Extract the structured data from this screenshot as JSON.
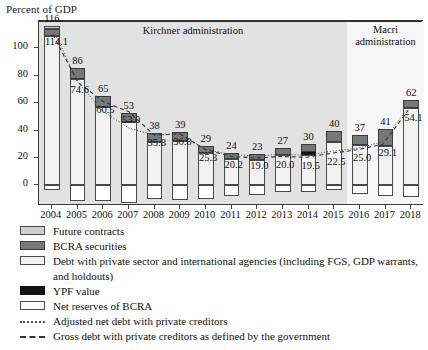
{
  "chart_data": {
    "type": "bar",
    "title": "Percent of GDP",
    "ylabel": "Percent of GDP",
    "xlabel": "",
    "ylim": [
      -15,
      120
    ],
    "yticks": [
      0,
      20,
      40,
      60,
      80,
      100
    ],
    "grid": false,
    "stacked": true,
    "categories": [
      "2004",
      "2005",
      "2006",
      "2007",
      "2008",
      "2009",
      "2010",
      "2011",
      "2012",
      "2013",
      "2014",
      "2015",
      "2016",
      "2017",
      "2018"
    ],
    "totals": [
      116,
      86,
      65,
      53,
      38,
      39,
      29,
      24,
      23,
      27,
      30,
      40,
      37,
      41,
      62
    ],
    "series": [
      {
        "name": "Net reserves of BCRA",
        "key": "reserves",
        "color": "#ffffff",
        "values": [
          -3.0,
          -11.5,
          -11.0,
          -12.5,
          -10.0,
          -10.5,
          -10.0,
          -8.0,
          -7.0,
          -5.0,
          -5.0,
          -3.0,
          -6.5,
          -8.0,
          -8.5
        ]
      },
      {
        "name": "Debt with private sector and international agencies (including FGS, GDP warrants, and holdouts)",
        "key": "debt",
        "color": "#f2f2f2",
        "values": [
          109.0,
          78.0,
          57.0,
          46.0,
          31.5,
          32.5,
          23.5,
          19.5,
          18.5,
          22.0,
          22.5,
          32.0,
          29.5,
          28.5,
          56.5
        ]
      },
      {
        "name": "YPF value",
        "key": "ypf",
        "color": "#111111",
        "values": [
          0,
          0,
          0,
          0,
          0,
          0,
          0,
          0,
          0,
          0,
          2.0,
          0,
          0,
          0,
          0
        ]
      },
      {
        "name": "BCRA securities",
        "key": "bcra",
        "color": "#77787a",
        "values": [
          5.5,
          8.0,
          8.0,
          7.0,
          6.5,
          6.5,
          5.5,
          4.5,
          4.5,
          5.0,
          5.5,
          8.0,
          7.5,
          12.5,
          5.5
        ]
      },
      {
        "name": "Future contracts",
        "key": "future",
        "color": "#cfcfcf",
        "values": [
          1.5,
          0,
          0,
          0,
          0,
          0,
          0,
          0,
          0,
          0,
          0,
          0,
          0,
          0,
          0
        ]
      }
    ],
    "lines": [
      {
        "name": "Adjusted net debt with private creditors",
        "style": "dotted",
        "values": [
          114.1,
          74.6,
          53.0,
          41.0,
          35.8,
          36.8,
          25.3,
          21.5,
          20.5,
          21.5,
          21.0,
          24.0,
          26.0,
          31.0,
          56.0
        ]
      },
      {
        "name": "Gross debt with private creditors as defined by the government",
        "style": "dashed",
        "values": [
          110.0,
          74.6,
          60.5,
          53.0,
          35.8,
          36.8,
          25.3,
          20.2,
          19.0,
          20.0,
          19.5,
          22.5,
          25.0,
          29.1,
          54.1
        ]
      }
    ],
    "bar_top_labels": [
      "116",
      "86",
      "65",
      "53",
      "38",
      "39",
      "29",
      "24",
      "23",
      "27",
      "30",
      "40",
      "37",
      "41",
      "62"
    ],
    "inline_labels": [
      {
        "text": "114.1",
        "year": "2004"
      },
      {
        "text": "74.6",
        "year": "2005"
      },
      {
        "text": "60.5",
        "year": "2006"
      },
      {
        "text": "53.0",
        "year": "2007"
      },
      {
        "text": "35.8",
        "year": "2008"
      },
      {
        "text": "36.8",
        "year": "2009"
      },
      {
        "text": "25.3",
        "year": "2010"
      },
      {
        "text": "20.2",
        "year": "2011"
      },
      {
        "text": "19.0",
        "year": "2012"
      },
      {
        "text": "20.0",
        "year": "2013"
      },
      {
        "text": "19.5",
        "year": "2014"
      },
      {
        "text": "22.5",
        "year": "2015"
      },
      {
        "text": "25.0",
        "year": "2016"
      },
      {
        "text": "29.1",
        "year": "2017"
      },
      {
        "text": "54.1",
        "year": "2018"
      }
    ],
    "regions": [
      {
        "label": "Kirchner administration",
        "from": "2004",
        "to": "2015",
        "color": "#e2e2e2"
      },
      {
        "label": "Macri administration",
        "from": "2016",
        "to": "2018",
        "color": "#f6f6f6"
      }
    ],
    "legend": [
      {
        "label": "Future contracts",
        "swatch": "future"
      },
      {
        "label": "BCRA securities",
        "swatch": "bcra"
      },
      {
        "label": "Debt with private sector and international agencies (including FGS, GDP warrants, and holdouts)",
        "swatch": "debt"
      },
      {
        "label": "YPF value",
        "swatch": "ypf"
      },
      {
        "label": "Net reserves of BCRA",
        "swatch": "reserves"
      },
      {
        "label": "Adjusted net debt with private creditors",
        "swatch": "dotted"
      },
      {
        "label": "Gross debt with private creditors as defined by the government",
        "swatch": "dashed"
      }
    ],
    "legend_position": "below"
  },
  "labels": {
    "y_axis_title": "Percent of GDP",
    "kirchner": "Kirchner administration",
    "macri_line1": "Macri",
    "macri_line2": "administration"
  }
}
